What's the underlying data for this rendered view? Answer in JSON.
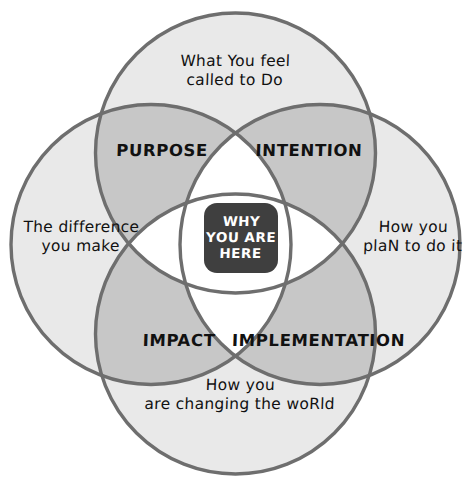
{
  "diagram": {
    "type": "venn-4-circle",
    "title": "Why You Are Here",
    "background_color": "#ffffff",
    "circle_stroke_color": "#6e6e6e",
    "circle_fill_color": "#e8e8e8",
    "circle_overlap_color": "#c8c8c8",
    "center_badge_color": "#3f3f3f",
    "center_badge_text_color": "#ffffff",
    "geometry": {
      "radius": 140,
      "circles": [
        {
          "name": "top",
          "cx": 235.5,
          "cy": 153
        },
        {
          "name": "left",
          "cx": 151,
          "cy": 244.5
        },
        {
          "name": "right",
          "cx": 320,
          "cy": 244.5
        },
        {
          "name": "bottom",
          "cx": 235.5,
          "cy": 334
        }
      ]
    },
    "center": {
      "text": "WHY\nYOU ARE\nHERE"
    },
    "outer_labels": {
      "top": "What You feel\ncalled to Do",
      "left": "The difference\nyou make",
      "right": "How you\nplaN to do it",
      "bottom": "How you\nare changing the woRld"
    },
    "quadrant_labels": {
      "purpose": "PURPOSE",
      "intention": "INTENTION",
      "impact": "IMPACT",
      "implementation": "IMPLEMENTATION"
    }
  }
}
